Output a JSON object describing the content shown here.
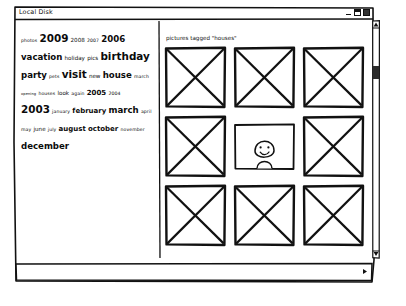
{
  "window": {
    "title": "Local Disk",
    "controls": [
      {
        "name": "minimize",
        "glyph": "–"
      },
      {
        "name": "maximize",
        "glyph": "□"
      },
      {
        "name": "close",
        "glyph": "×"
      }
    ]
  },
  "tag_cloud": {
    "lines": [
      [
        {
          "text": "photos",
          "size": 2
        },
        {
          "text": "2009",
          "size": 6
        },
        {
          "text": "2008",
          "size": 3
        },
        {
          "text": "2007",
          "size": 2
        },
        {
          "text": "2006",
          "size": 5
        }
      ],
      [
        {
          "text": "vacation",
          "size": 5
        },
        {
          "text": "holiday",
          "size": 3
        },
        {
          "text": "pics",
          "size": 3
        },
        {
          "text": "birthday",
          "size": 6
        }
      ],
      [
        {
          "text": "party",
          "size": 5
        },
        {
          "text": "pets",
          "size": 2
        },
        {
          "text": "visit",
          "size": 6
        },
        {
          "text": "new",
          "size": 3
        },
        {
          "text": "house",
          "size": 5
        },
        {
          "text": "march",
          "size": 2
        }
      ],
      [
        {
          "text": "opening",
          "size": 1
        },
        {
          "text": "houses",
          "size": 2
        },
        {
          "text": "look",
          "size": 3
        },
        {
          "text": "again",
          "size": 2
        },
        {
          "text": "2005",
          "size": 4
        },
        {
          "text": "2004",
          "size": 2
        }
      ],
      [
        {
          "text": "2003",
          "size": 6
        },
        {
          "text": "january",
          "size": 2
        },
        {
          "text": "february",
          "size": 4
        },
        {
          "text": "march",
          "size": 5
        },
        {
          "text": "april",
          "size": 2
        }
      ],
      [
        {
          "text": "may",
          "size": 2
        },
        {
          "text": "june",
          "size": 3
        },
        {
          "text": "july",
          "size": 2
        },
        {
          "text": "august",
          "size": 4
        },
        {
          "text": "october",
          "size": 4
        },
        {
          "text": "november",
          "size": 2
        }
      ],
      [
        {
          "text": "december",
          "size": 5
        }
      ]
    ]
  },
  "results": {
    "heading": "pictures tagged \"houses\"",
    "thumbnails": [
      {
        "id": 1,
        "kind": "placeholder"
      },
      {
        "id": 2,
        "kind": "placeholder"
      },
      {
        "id": 3,
        "kind": "placeholder"
      },
      {
        "id": 4,
        "kind": "placeholder"
      },
      {
        "id": 5,
        "kind": "portrait"
      },
      {
        "id": 6,
        "kind": "placeholder"
      },
      {
        "id": 7,
        "kind": "placeholder"
      },
      {
        "id": 8,
        "kind": "placeholder"
      },
      {
        "id": 9,
        "kind": "placeholder"
      }
    ]
  },
  "colors": {
    "ink": "#111111",
    "paper": "#ffffff"
  }
}
